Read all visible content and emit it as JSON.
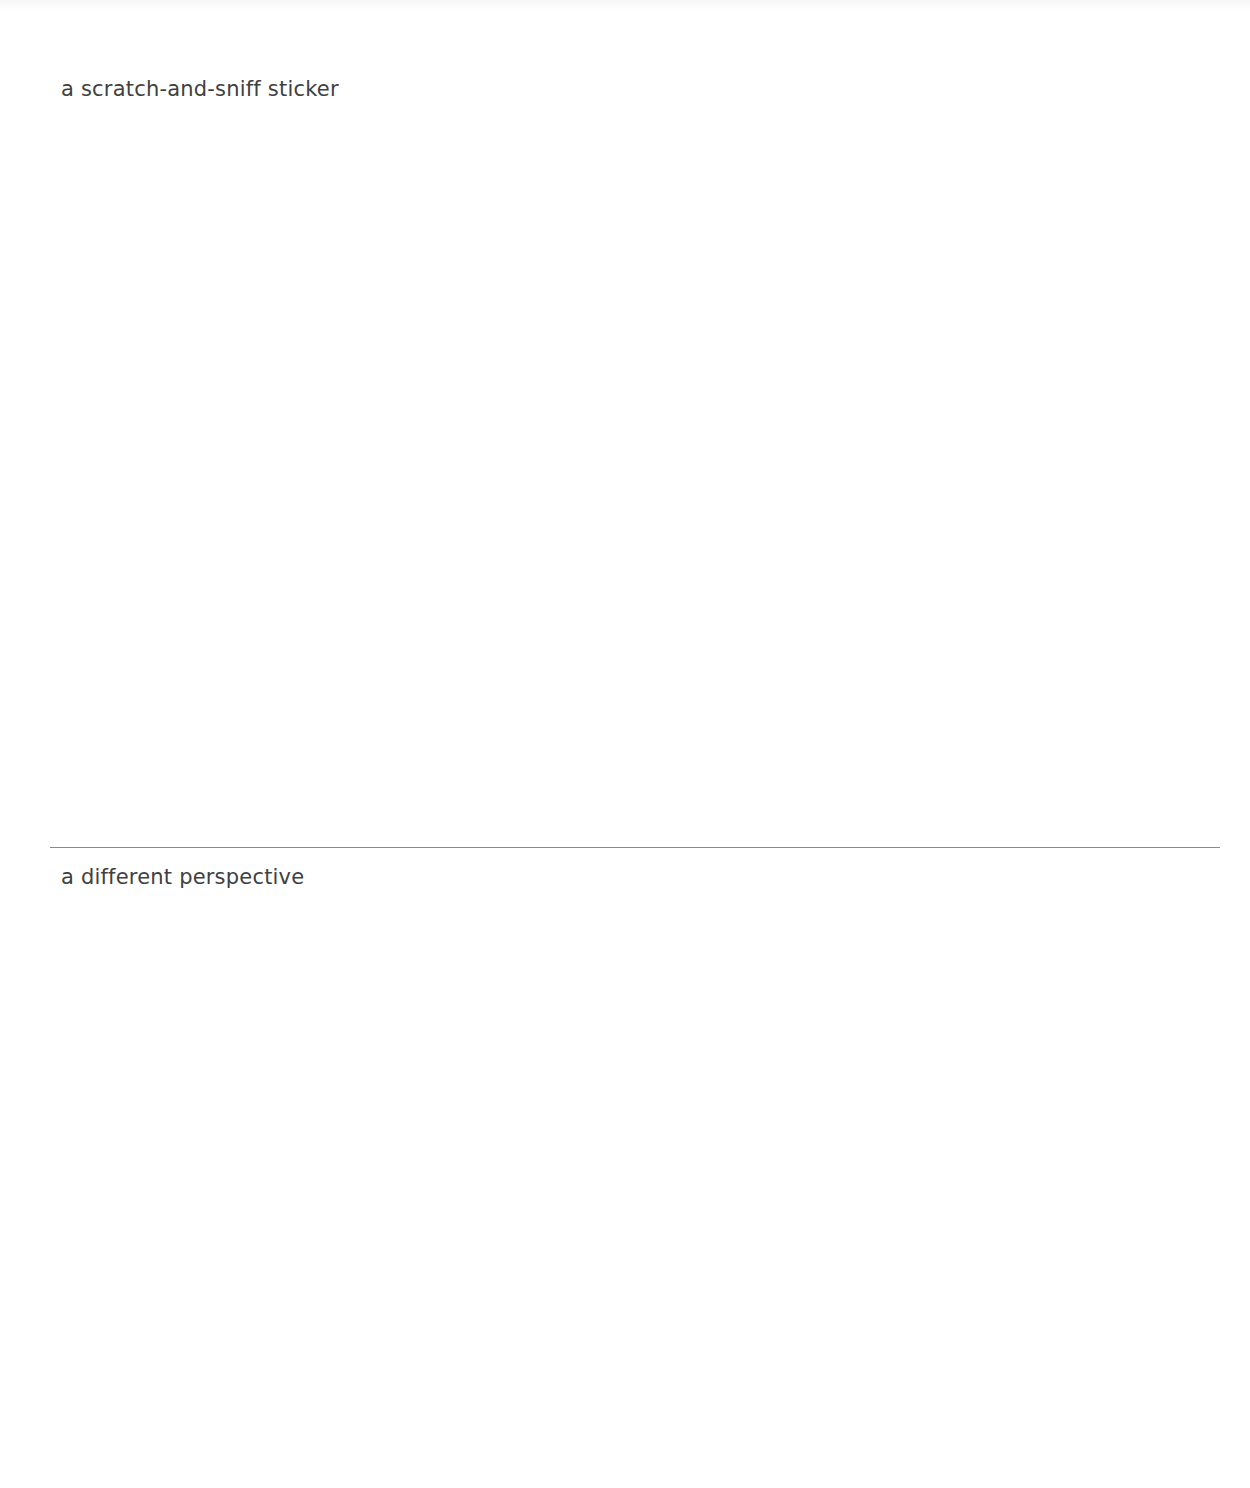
{
  "page": {
    "background": "#ffffff",
    "text_color": "#404040",
    "divider_color": "#8a8a8a"
  },
  "cards": [
    {
      "label": "a scratch-and-sniff sticker"
    },
    {
      "label": "a different perspective"
    }
  ]
}
